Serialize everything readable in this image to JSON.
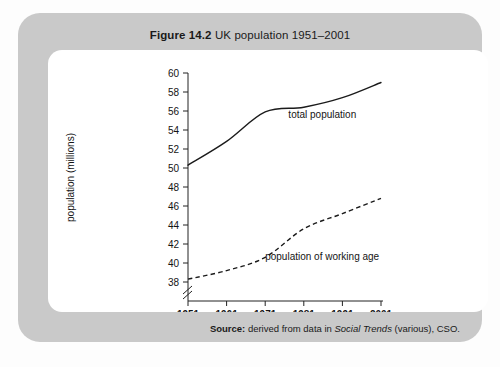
{
  "figure": {
    "number": "Figure 14.2",
    "title": "UK population 1951–2001"
  },
  "source": {
    "label": "Source:",
    "text_before": " derived from data in ",
    "italic": "Social Trends",
    "text_after": " (various), CSO."
  },
  "chart_data": {
    "type": "line",
    "title": "UK population 1951–2001",
    "xlabel": "",
    "ylabel": "population (millions)",
    "x": [
      1951,
      1961,
      1971,
      1981,
      1991,
      2001
    ],
    "xticklabels": [
      "1951",
      "1961",
      "1971",
      "1981",
      "1991",
      "2001"
    ],
    "xlim": [
      1951,
      2001
    ],
    "ylim": [
      38,
      60
    ],
    "yticks": [
      38,
      40,
      42,
      44,
      46,
      48,
      50,
      52,
      54,
      56,
      58,
      60
    ],
    "yticklabels": [
      "38",
      "40",
      "42",
      "44",
      "46",
      "48",
      "50",
      "52",
      "54",
      "56",
      "58",
      "60"
    ],
    "y_axis_break": true,
    "grid": false,
    "legend": "inline-annotations",
    "series": [
      {
        "name": "total population",
        "style": "solid",
        "label_x": 1977,
        "label_y": 55.3,
        "values": [
          50.3,
          52.8,
          55.9,
          56.4,
          57.4,
          59.0
        ]
      },
      {
        "name": "population of working age",
        "style": "dashed",
        "label_x": 1971,
        "label_y": 40.3,
        "values": [
          38.3,
          39.2,
          40.6,
          43.6,
          45.2,
          46.8
        ]
      }
    ]
  }
}
